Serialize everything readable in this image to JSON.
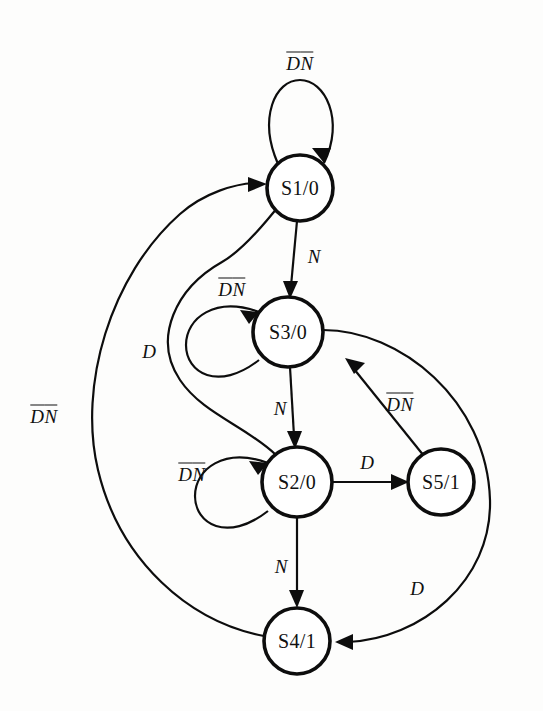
{
  "diagram": {
    "type": "finite-state-machine",
    "colors": {
      "background": "#fdfdfc",
      "stroke": "#0d0d0d",
      "fill": "#ffffff"
    },
    "states": [
      {
        "id": "S1",
        "label": "S1/0",
        "cx": 300,
        "cy": 188,
        "r": 33
      },
      {
        "id": "S3",
        "label": "S3/0",
        "cx": 288,
        "cy": 332,
        "r": 35
      },
      {
        "id": "S2",
        "label": "S2/0",
        "cx": 297,
        "cy": 482,
        "r": 35
      },
      {
        "id": "S5",
        "label": "S5/1",
        "cx": 441,
        "cy": 482,
        "r": 33
      },
      {
        "id": "S4",
        "label": "S4/1",
        "cx": 297,
        "cy": 641,
        "r": 33
      }
    ],
    "transitions": [
      {
        "id": "t-s1-self",
        "from": "S1",
        "to": "S1",
        "label": "DN",
        "label_overbars": [
          true,
          true
        ],
        "kind": "self-loop",
        "label_x": 300,
        "label_y": 62
      },
      {
        "id": "t-s3-self",
        "from": "S3",
        "to": "S3",
        "label": "DN",
        "label_overbars": [
          true,
          true
        ],
        "kind": "self-loop",
        "label_x": 232,
        "label_y": 288
      },
      {
        "id": "t-s2-self",
        "from": "S2",
        "to": "S2",
        "label": "DN",
        "label_overbars": [
          true,
          true
        ],
        "kind": "self-loop",
        "label_x": 192,
        "label_y": 473
      },
      {
        "id": "t-s1-s3",
        "from": "S1",
        "to": "S3",
        "label": "N",
        "label_overbars": [
          false
        ],
        "kind": "straight",
        "label_x": 314,
        "label_y": 256
      },
      {
        "id": "t-s3-s2",
        "from": "S3",
        "to": "S2",
        "label": "N",
        "label_overbars": [
          false
        ],
        "kind": "straight",
        "label_x": 280,
        "label_y": 408
      },
      {
        "id": "t-s2-s4",
        "from": "S2",
        "to": "S4",
        "label": "N",
        "label_overbars": [
          false
        ],
        "kind": "straight",
        "label_x": 281,
        "label_y": 566
      },
      {
        "id": "t-s2-s5",
        "from": "S2",
        "to": "S5",
        "label": "D",
        "label_overbars": [
          false
        ],
        "kind": "straight",
        "label_x": 367,
        "label_y": 462
      },
      {
        "id": "t-s5-s3",
        "from": "S5",
        "to": "S3",
        "label": "DN",
        "label_overbars": [
          true,
          true
        ],
        "kind": "straight",
        "label_x": 400,
        "label_y": 403
      },
      {
        "id": "t-s2-s1",
        "from": "S2",
        "to": "S1",
        "label": "D",
        "label_overbars": [
          false
        ],
        "kind": "curve",
        "label_x": 149,
        "label_y": 351
      },
      {
        "id": "t-s4-s1",
        "from": "S4",
        "to": "S1",
        "label": "DN",
        "label_overbars": [
          true,
          true
        ],
        "kind": "curve",
        "label_x": 44,
        "label_y": 415
      },
      {
        "id": "t-s3-s4",
        "from": "S3",
        "to": "S4",
        "label": "D",
        "label_overbars": [
          false
        ],
        "kind": "curve",
        "label_x": 417,
        "label_y": 588
      }
    ]
  }
}
